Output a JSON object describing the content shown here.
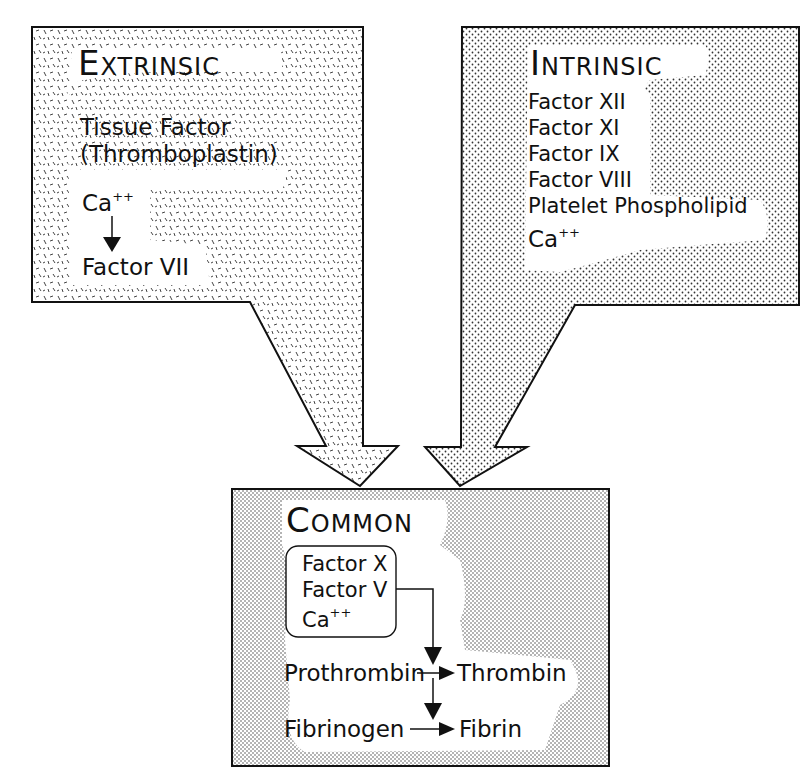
{
  "diagram": {
    "colors": {
      "stroke": "#111111",
      "background": "#ffffff",
      "pattern_ink": "#333333"
    }
  },
  "extrinsic": {
    "title": "Extrinsic",
    "tissue_factor_line1": "Tissue Factor",
    "tissue_factor_line2": "(Thromboplastin)",
    "calcium": "Ca",
    "calcium_charge": "++",
    "factor": "Factor VII",
    "pattern": "dashes"
  },
  "intrinsic": {
    "title": "Intrinsic",
    "items": [
      "Factor XII",
      "Factor XI",
      "Factor IX",
      "Factor VIII",
      "Platelet Phospholipid"
    ],
    "calcium": "Ca",
    "calcium_charge": "++",
    "pattern": "dots"
  },
  "common": {
    "title": "Common",
    "complex": {
      "items": [
        "Factor X",
        "Factor V"
      ],
      "calcium": "Ca",
      "calcium_charge": "++"
    },
    "reactions": [
      {
        "from": "Prothrombin",
        "to": "Thrombin"
      },
      {
        "from": "Fibrinogen",
        "to": "Fibrin"
      }
    ],
    "pattern": "fine-dots"
  }
}
